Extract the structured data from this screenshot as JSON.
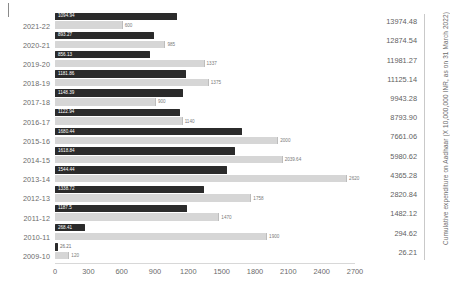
{
  "chart_data": {
    "type": "bar",
    "orientation": "horizontal",
    "title": "",
    "xlabel": "",
    "ylabel": "",
    "xlim": [
      0,
      2700
    ],
    "xticks": [
      "0",
      "300",
      "600",
      "900",
      "1200",
      "1500",
      "1800",
      "2100",
      "2400",
      "2700"
    ],
    "grid": false,
    "legend_position": "none",
    "categories": [
      "2021-22",
      "2020-21",
      "2019-20",
      "2018-19",
      "2017-18",
      "2016-17",
      "2015-16",
      "2014-15",
      "2013-14",
      "2012-13",
      "2011-12",
      "2010-11",
      "2009-10"
    ],
    "series": [
      {
        "name": "expenditure",
        "color": "#2b2b2b",
        "values": [
          1094.94,
          893.27,
          856.13,
          1181.86,
          1148.39,
          1122.94,
          1680.44,
          1618.84,
          1544.44,
          1338.72,
          1187.5,
          268.41,
          26.21
        ],
        "labels": [
          "1094.94",
          "893.27",
          "856.13",
          "1181.86",
          "1148.39",
          "1122.94",
          "1680.44",
          "1618.84",
          "1544.44",
          "1338.72",
          "1187.5",
          "268.41",
          "26.21"
        ]
      },
      {
        "name": "allocation",
        "color": "#d6d6d6",
        "values": [
          600,
          985,
          1337,
          1375,
          900,
          1140,
          2000,
          2039.64,
          2620,
          1758,
          1470,
          1900,
          120
        ],
        "labels": [
          "600",
          "985",
          "1337",
          "1375",
          "900",
          "1140",
          "2000",
          "2039.64",
          "2620",
          "1758",
          "1470",
          "1900",
          "120"
        ]
      }
    ],
    "secondary_axis": {
      "title": "Cumulative expenditure on Aadhaar (X 10,000,000 INR, as on 31 March 2022)",
      "values": [
        "13974.48",
        "12874.54",
        "11981.27",
        "11125.14",
        "9943.28",
        "8793.90",
        "7661.06",
        "5980.62",
        "4365.28",
        "2820.84",
        "1482.12",
        "294.62",
        "26.21"
      ]
    }
  }
}
